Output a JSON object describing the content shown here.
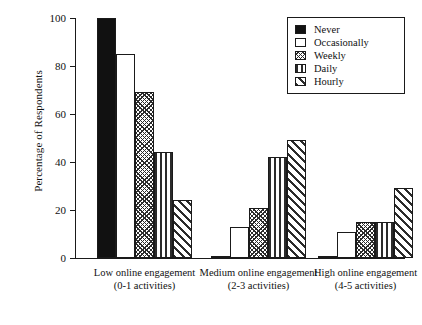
{
  "chart_data": {
    "type": "bar",
    "title": "",
    "xlabel": "",
    "ylabel": "Percentage of Respondents",
    "ylim": [
      0,
      100
    ],
    "yticks": [
      0,
      20,
      40,
      60,
      80,
      100
    ],
    "grid": false,
    "legend_position": "top-right",
    "categories": [
      "Low online engagement (0-1 activities)",
      "Medium online engagement (2-3 activities)",
      "High online engagement (4-5 activities)"
    ],
    "category_lines": [
      {
        "line1": "Low online engagement",
        "line2": "(0-1 activities)"
      },
      {
        "line1": "Medium online engagement",
        "line2": "(2-3 activities)"
      },
      {
        "line1": "High online engagement",
        "line2": "(4-5 activities)"
      }
    ],
    "series": [
      {
        "name": "Never",
        "pattern": "solid-black",
        "values": [
          100,
          1,
          1
        ]
      },
      {
        "name": "Occasionally",
        "pattern": "empty-white",
        "values": [
          85,
          13,
          11
        ]
      },
      {
        "name": "Weekly",
        "pattern": "crosshatch",
        "values": [
          69,
          21,
          15
        ]
      },
      {
        "name": "Daily",
        "pattern": "vertical-lines",
        "values": [
          44,
          42,
          15
        ]
      },
      {
        "name": "Hourly",
        "pattern": "diagonal-hatch",
        "values": [
          24,
          49,
          29
        ]
      }
    ]
  },
  "legend": {
    "items": [
      {
        "label": "Never"
      },
      {
        "label": "Occasionally"
      },
      {
        "label": "Weekly"
      },
      {
        "label": "Daily"
      },
      {
        "label": "Hourly"
      }
    ]
  },
  "colors": {
    "axis": "#1a1a1a",
    "bar_outline": "#1a1a1a",
    "fill_dark": "#111111",
    "background": "#ffffff"
  }
}
